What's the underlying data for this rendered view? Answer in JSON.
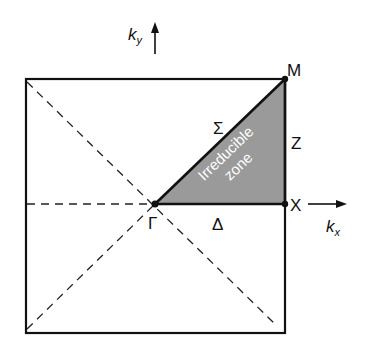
{
  "diagram": {
    "axes": {
      "kx": {
        "base": "k",
        "sub": "x"
      },
      "ky": {
        "base": "k",
        "sub": "y"
      }
    },
    "points": {
      "gamma": "Γ",
      "x": "X",
      "m": "M"
    },
    "lines": {
      "delta": "Δ",
      "sigma": "Σ",
      "z": "Z"
    },
    "zone_label": {
      "line1": "Irreducible",
      "line2": "zone"
    },
    "colors": {
      "zone_fill": "#9a9a9a",
      "stroke": "#111111"
    }
  }
}
